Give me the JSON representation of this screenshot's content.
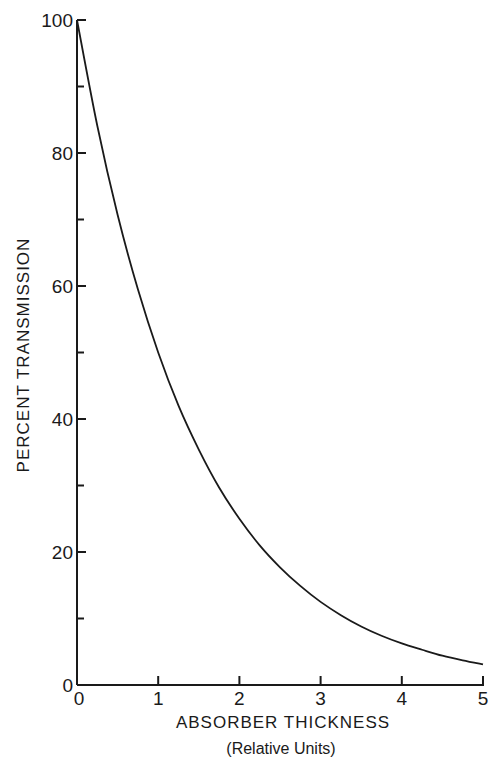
{
  "chart_data": {
    "type": "line",
    "title": "",
    "xlabel": "ABSORBER THICKNESS",
    "xlabel_sub": "(Relative Units)",
    "ylabel": "PERCENT TRANSMISSION",
    "xlim": [
      0,
      5
    ],
    "ylim": [
      0,
      100
    ],
    "grid": false,
    "legend": null,
    "x_ticks": [
      0,
      1,
      2,
      3,
      4,
      5
    ],
    "x_tick_labels": [
      "0",
      "1",
      "2",
      "3",
      "4",
      "5"
    ],
    "y_ticks": [
      0,
      20,
      40,
      60,
      80,
      100
    ],
    "y_tick_labels": [
      "0",
      "20",
      "40",
      "60",
      "80",
      "100"
    ],
    "y_minor_ticks": [
      10,
      30,
      50,
      70,
      90
    ],
    "series": [
      {
        "name": "Transmission",
        "color": "#1a1a1a",
        "x": [
          0,
          0.25,
          0.5,
          0.75,
          1,
          1.25,
          1.5,
          1.75,
          2,
          2.25,
          2.5,
          2.75,
          3,
          3.25,
          3.5,
          3.75,
          4,
          4.25,
          4.5,
          4.75,
          5
        ],
        "values": [
          100,
          84.1,
          70.7,
          59.5,
          50,
          42.0,
          35.4,
          29.7,
          25,
          21.0,
          17.7,
          14.9,
          12.5,
          10.5,
          8.8,
          7.4,
          6.25,
          5.3,
          4.4,
          3.7,
          3.1
        ]
      }
    ]
  }
}
